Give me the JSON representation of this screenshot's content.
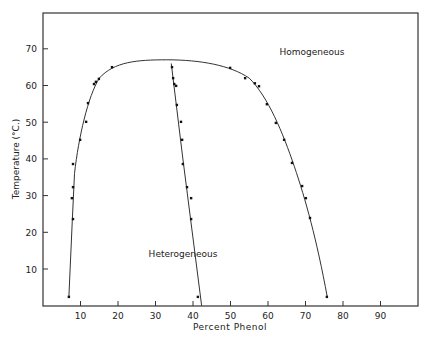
{
  "chart_data": {
    "type": "scatter",
    "title": "",
    "xlabel": "Percent Phenol",
    "ylabel": "Temperature (°C.)",
    "xlim": [
      0,
      100
    ],
    "ylim": [
      0,
      80
    ],
    "x_ticks": [
      10,
      20,
      30,
      40,
      50,
      60,
      70,
      80,
      90
    ],
    "y_ticks": [
      10,
      20,
      30,
      40,
      50,
      60,
      70
    ],
    "grid": false,
    "legend": null,
    "annotations": [
      {
        "text": "Homogeneous",
        "x": 68,
        "y": 69
      },
      {
        "text": "Heterogeneous",
        "x": 35,
        "y": 16
      }
    ],
    "series": [
      {
        "name": "left-branch",
        "points": [
          [
            6.9,
            2.4
          ],
          [
            8.0,
            23.6
          ],
          [
            7.7,
            29.3
          ],
          [
            8.0,
            32.3
          ],
          [
            8.0,
            38.6
          ],
          [
            9.9,
            45.2
          ],
          [
            11.5,
            50.1
          ],
          [
            12.0,
            55.2
          ],
          [
            13.6,
            60.4
          ],
          [
            14.1,
            61.0
          ],
          [
            14.9,
            61.8
          ],
          [
            18.4,
            65.0
          ]
        ]
      },
      {
        "name": "middle-branch",
        "points": [
          [
            41.3,
            2.4
          ],
          [
            39.5,
            23.6
          ],
          [
            39.5,
            29.3
          ],
          [
            38.4,
            32.3
          ],
          [
            37.3,
            38.6
          ],
          [
            37.1,
            45.2
          ],
          [
            36.8,
            50.1
          ],
          [
            35.7,
            54.7
          ],
          [
            35.5,
            59.9
          ],
          [
            35.0,
            60.4
          ],
          [
            34.7,
            62.0
          ],
          [
            34.4,
            65.0
          ]
        ]
      },
      {
        "name": "right-branch",
        "points": [
          [
            75.7,
            2.4
          ],
          [
            71.2,
            23.9
          ],
          [
            70.1,
            29.3
          ],
          [
            69.1,
            32.6
          ],
          [
            66.4,
            38.9
          ],
          [
            64.3,
            45.2
          ],
          [
            62.1,
            49.8
          ],
          [
            59.7,
            54.9
          ],
          [
            57.6,
            59.8
          ],
          [
            56.5,
            60.6
          ],
          [
            53.9,
            62.0
          ],
          [
            49.9,
            64.8
          ]
        ]
      }
    ],
    "curves": {
      "solubility_curve": "Phenol-water mutual solubility curve, critical maximum near 67°C at ~33% phenol",
      "curve_max_temp": 67
    }
  }
}
